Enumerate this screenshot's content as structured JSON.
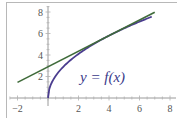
{
  "chart_data": {
    "type": "line",
    "title": "",
    "xlabel": "",
    "ylabel": "",
    "xlim": [
      -2,
      8
    ],
    "ylim": [
      0,
      8
    ],
    "grid": false,
    "x_ticks": [
      "-2",
      "2",
      "4",
      "6",
      "8"
    ],
    "y_ticks": [
      "2",
      "4",
      "6",
      "8"
    ],
    "annotation": "y = f(x)",
    "series": [
      {
        "name": "f(x)",
        "color": "#4b3d8f",
        "description": "concave increasing curve starting at origin",
        "x": [
          0,
          0.25,
          0.5,
          1,
          2,
          3,
          4,
          5,
          6,
          6.8
        ],
        "y": [
          0,
          1.45,
          2.05,
          2.9,
          4.1,
          5.02,
          5.8,
          6.48,
          7.1,
          7.56
        ]
      },
      {
        "name": "tangent line",
        "color": "#3f6b3a",
        "description": "tangent line to f at x = 4",
        "x": [
          -2,
          7
        ],
        "y": [
          1.45,
          7.98
        ]
      }
    ]
  },
  "labels": {
    "equation": "y = f(x)",
    "x_ticks": [
      {
        "value": -2,
        "text": "−2"
      },
      {
        "value": 2,
        "text": "2"
      },
      {
        "value": 4,
        "text": "4"
      },
      {
        "value": 6,
        "text": "6"
      },
      {
        "value": 8,
        "text": "8"
      }
    ],
    "y_ticks": [
      {
        "value": 2,
        "text": "2"
      },
      {
        "value": 4,
        "text": "4"
      },
      {
        "value": 6,
        "text": "6"
      },
      {
        "value": 8,
        "text": "8"
      }
    ]
  }
}
